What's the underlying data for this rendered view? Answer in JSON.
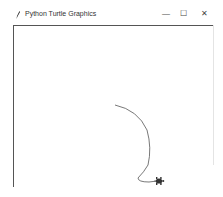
{
  "window": {
    "title": "Python Turtle Graphics",
    "controls": {
      "minimize": "—",
      "maximize": "☐",
      "close": "✕"
    }
  },
  "canvas": {
    "background": "#ffffff",
    "pen_color": "#555555",
    "turtle_color": "#333333",
    "path_points": [
      [
        115,
        105
      ],
      [
        130,
        110
      ],
      [
        142,
        122
      ],
      [
        149,
        135
      ],
      [
        150,
        150
      ],
      [
        148,
        165
      ],
      [
        143,
        172
      ],
      [
        138,
        178
      ],
      [
        140,
        181
      ],
      [
        149,
        182
      ],
      [
        157,
        181
      ]
    ],
    "turtle": {
      "x": 159,
      "y": 181,
      "heading": "east"
    }
  }
}
